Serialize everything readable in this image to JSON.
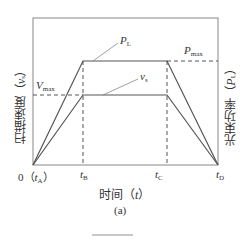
{
  "figure": {
    "caption": "(a)",
    "x_axis_label": "时间（",
    "x_axis_var": "t",
    "x_axis_close": "）",
    "left_axis_label": "扫描速度（",
    "left_axis_var": "v",
    "left_axis_sub": "s",
    "left_axis_close": "）",
    "right_axis_label": "光束功率（",
    "right_axis_var": "P",
    "right_axis_sub": "L",
    "right_axis_close": "）",
    "ticks": {
      "origin": "0（",
      "tA_var": "t",
      "tA_sub": "A",
      "tA_close": "）",
      "tB_var": "t",
      "tB_sub": "B",
      "tC_var": "t",
      "tC_sub": "C",
      "tD_var": "t",
      "tD_sub": "D"
    },
    "annotations": {
      "PL_var": "P",
      "PL_sub": "L",
      "Pmax_var": "P",
      "Pmax_sub": "max",
      "vs_var": "v",
      "vs_sub": "s",
      "Vmax_var": "V",
      "Vmax_sub": "max"
    },
    "colors": {
      "line": "#555555",
      "frame": "#777777",
      "text": "#333333"
    }
  }
}
